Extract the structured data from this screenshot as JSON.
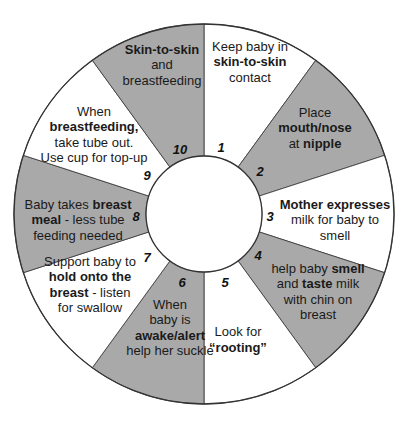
{
  "diagram": {
    "type": "circular-cycle",
    "colors": {
      "shaded": "#a9a9a9",
      "unshaded": "#ffffff",
      "outline": "#333333"
    },
    "center": {
      "x": 204,
      "y": 214
    },
    "outer_radius": 190,
    "inner_radius": 58,
    "steps": [
      {
        "number": "1",
        "shaded": false,
        "lines": [
          [
            {
              "t": "Keep baby in",
              "b": false
            }
          ],
          [
            {
              "t": "skin-to-skin",
              "b": true
            }
          ],
          [
            {
              "t": "contact",
              "b": false
            }
          ]
        ]
      },
      {
        "number": "2",
        "shaded": true,
        "lines": [
          [
            {
              "t": "Place",
              "b": false
            }
          ],
          [
            {
              "t": "mouth/nose",
              "b": true
            }
          ],
          [
            {
              "t": "at ",
              "b": false
            },
            {
              "t": "nipple",
              "b": true
            }
          ]
        ]
      },
      {
        "number": "3",
        "shaded": false,
        "lines": [
          [
            {
              "t": "Mother expresses",
              "b": true
            }
          ],
          [
            {
              "t": "milk for baby to",
              "b": false
            }
          ],
          [
            {
              "t": "smell",
              "b": false
            }
          ]
        ]
      },
      {
        "number": "4",
        "shaded": true,
        "lines": [
          [
            {
              "t": "help baby ",
              "b": false
            },
            {
              "t": "smell",
              "b": true
            }
          ],
          [
            {
              "t": "and ",
              "b": false
            },
            {
              "t": "taste",
              "b": true
            },
            {
              "t": " milk",
              "b": false
            }
          ],
          [
            {
              "t": "with chin on",
              "b": false
            }
          ],
          [
            {
              "t": "breast",
              "b": false
            }
          ]
        ]
      },
      {
        "number": "5",
        "shaded": false,
        "lines": [
          [
            {
              "t": "Look for",
              "b": false
            }
          ],
          [
            {
              "t": "“rooting”",
              "b": true
            }
          ]
        ]
      },
      {
        "number": "6",
        "shaded": true,
        "lines": [
          [
            {
              "t": "When",
              "b": false
            }
          ],
          [
            {
              "t": "baby is",
              "b": false
            }
          ],
          [
            {
              "t": "awake/alert",
              "b": true
            }
          ],
          [
            {
              "t": "help her suckle",
              "b": false
            }
          ]
        ]
      },
      {
        "number": "7",
        "shaded": false,
        "lines": [
          [
            {
              "t": "Support baby to",
              "b": false
            }
          ],
          [
            {
              "t": "hold onto the",
              "b": true
            }
          ],
          [
            {
              "t": "breast",
              "b": true
            },
            {
              "t": " - listen",
              "b": false
            }
          ],
          [
            {
              "t": "for swallow",
              "b": false
            }
          ]
        ]
      },
      {
        "number": "8",
        "shaded": true,
        "lines": [
          [
            {
              "t": "Baby takes ",
              "b": false
            },
            {
              "t": "breast",
              "b": true
            }
          ],
          [
            {
              "t": "meal",
              "b": true
            },
            {
              "t": " - less tube",
              "b": false
            }
          ],
          [
            {
              "t": "feeding needed",
              "b": false
            }
          ]
        ]
      },
      {
        "number": "9",
        "shaded": false,
        "lines": [
          [
            {
              "t": "When",
              "b": false
            }
          ],
          [
            {
              "t": "breastfeeding,",
              "b": true
            }
          ],
          [
            {
              "t": "take tube out.",
              "b": false
            }
          ],
          [
            {
              "t": "Use cup for top-up",
              "b": false
            }
          ]
        ]
      },
      {
        "number": "10",
        "shaded": true,
        "lines": [
          [
            {
              "t": "Skin-to-skin",
              "b": true
            }
          ],
          [
            {
              "t": "and",
              "b": false
            }
          ],
          [
            {
              "t": "breastfeeding",
              "b": false
            }
          ]
        ]
      }
    ],
    "text_positions": [
      {
        "x": 250,
        "y": 62
      },
      {
        "x": 315,
        "y": 128
      },
      {
        "x": 335,
        "y": 220
      },
      {
        "x": 318,
        "y": 292
      },
      {
        "x": 238,
        "y": 340
      },
      {
        "x": 170,
        "y": 328
      },
      {
        "x": 90,
        "y": 285
      },
      {
        "x": 78,
        "y": 220
      },
      {
        "x": 94,
        "y": 135
      },
      {
        "x": 162,
        "y": 65
      }
    ],
    "number_positions": [
      {
        "x": 221,
        "y": 152
      },
      {
        "x": 260,
        "y": 176
      },
      {
        "x": 270,
        "y": 221
      },
      {
        "x": 258,
        "y": 260
      },
      {
        "x": 225,
        "y": 287
      },
      {
        "x": 182,
        "y": 287
      },
      {
        "x": 147,
        "y": 262
      },
      {
        "x": 136,
        "y": 221
      },
      {
        "x": 147,
        "y": 180
      },
      {
        "x": 180,
        "y": 154
      }
    ]
  }
}
